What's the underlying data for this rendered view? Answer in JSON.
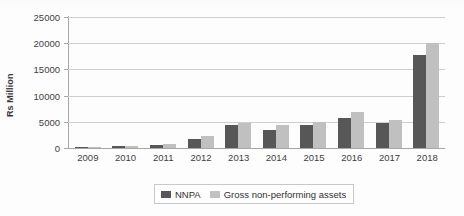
{
  "chart_data": {
    "type": "bar",
    "title": "",
    "xlabel": "",
    "ylabel": "Rs Million",
    "categories": [
      "2009",
      "2010",
      "2011",
      "2012",
      "2013",
      "2014",
      "2015",
      "2016",
      "2017",
      "2018"
    ],
    "series": [
      {
        "name": "NNPA",
        "color": "#575757",
        "values": [
          100,
          300,
          600,
          1800,
          4300,
          3400,
          4300,
          5700,
          4700,
          17800
        ]
      },
      {
        "name": "Gross non-performing assets",
        "color": "#c0c0c0",
        "values": [
          150,
          400,
          800,
          2200,
          4800,
          4300,
          4900,
          6800,
          5400,
          20000
        ]
      }
    ],
    "ylim": [
      0,
      25000
    ],
    "ytick_values": [
      0,
      5000,
      10000,
      15000,
      20000,
      25000
    ],
    "ytick_labels": [
      "0",
      "5000",
      "10000",
      "15000",
      "20000",
      "25000"
    ],
    "grid": true,
    "legend_position": "bottom"
  },
  "axis": {
    "y_title": "Rs Million"
  },
  "legend": {
    "items": [
      {
        "label": "NNPA"
      },
      {
        "label": "Gross non-performing assets"
      }
    ]
  }
}
